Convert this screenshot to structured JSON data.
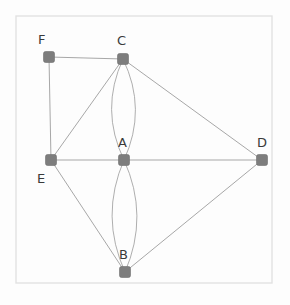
{
  "figure": {
    "type": "undirected-multigraph-diagram",
    "background_color": "#fdfdfd",
    "frame": {
      "name": "figure-frame",
      "x": 16,
      "y": 16,
      "width": 256,
      "height": 267,
      "stroke": "#e2e2e2",
      "stroke_width": 1.4
    },
    "node_style": {
      "shape": "rounded-square",
      "size": 11,
      "corner_radius": 2,
      "fill": "#7d7d7d",
      "stroke": "#6e6e6e",
      "stroke_width": 0.6
    },
    "edge_style": {
      "stroke": "#9d9d9d",
      "stroke_width": 0.9,
      "curved_stroke": "#a5a5a5",
      "curved_stroke_width": 0.9
    },
    "label_style": {
      "color": "#3a3a3a",
      "font_size_px": 13
    }
  },
  "nodes": [
    {
      "id": "F",
      "label": "F",
      "x": 49,
      "y": 57,
      "label_x": 38,
      "label_y": 33
    },
    {
      "id": "C",
      "label": "C",
      "x": 123,
      "y": 59,
      "label_x": 117,
      "label_y": 34
    },
    {
      "id": "A",
      "label": "A",
      "x": 124,
      "y": 160,
      "label_x": 118,
      "label_y": 136
    },
    {
      "id": "B",
      "label": "B",
      "x": 125,
      "y": 272,
      "label_x": 119,
      "label_y": 248
    },
    {
      "id": "D",
      "label": "D",
      "x": 262,
      "y": 160,
      "label_x": 257,
      "label_y": 136
    },
    {
      "id": "E",
      "label": "E",
      "x": 51,
      "y": 160,
      "label_x": 37,
      "label_y": 172
    }
  ],
  "edges": [
    {
      "id": "F-C",
      "source": "F",
      "target": "C",
      "kind": "straight",
      "curvature": 0
    },
    {
      "id": "F-E",
      "source": "F",
      "target": "E",
      "kind": "straight",
      "curvature": 0
    },
    {
      "id": "C-E",
      "source": "C",
      "target": "E",
      "kind": "straight",
      "curvature": 0
    },
    {
      "id": "C-D",
      "source": "C",
      "target": "D",
      "kind": "straight",
      "curvature": 0
    },
    {
      "id": "E-A",
      "source": "E",
      "target": "A",
      "kind": "straight",
      "curvature": 0
    },
    {
      "id": "A-D",
      "source": "A",
      "target": "D",
      "kind": "straight",
      "curvature": 0
    },
    {
      "id": "E-B",
      "source": "E",
      "target": "B",
      "kind": "straight",
      "curvature": 0
    },
    {
      "id": "B-D",
      "source": "B",
      "target": "D",
      "kind": "straight",
      "curvature": 0
    },
    {
      "id": "C-A-left",
      "source": "C",
      "target": "A",
      "kind": "curved",
      "curvature": -24
    },
    {
      "id": "C-A-right",
      "source": "C",
      "target": "A",
      "kind": "curved",
      "curvature": 24
    },
    {
      "id": "A-B-left",
      "source": "A",
      "target": "B",
      "kind": "curved",
      "curvature": -25
    },
    {
      "id": "A-B-right",
      "source": "A",
      "target": "B",
      "kind": "curved",
      "curvature": 25
    }
  ]
}
